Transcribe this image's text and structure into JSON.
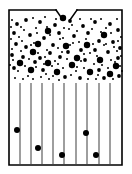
{
  "figure": {
    "domain": "diagram",
    "canvas": {
      "width": 132,
      "height": 174,
      "background": "#ffffff"
    },
    "stroke_color": "#000000",
    "particle_color": "#000000",
    "channel_color": "#1a1a1a"
  },
  "vessel": {
    "name": "vessel-body",
    "left": 9,
    "right": 122,
    "top": 10,
    "bottom": 165,
    "outline_width": 1.6,
    "notch": {
      "name": "top-notch-opening",
      "left_edge_start_x": 56,
      "left_edge_end_x": 63,
      "right_edge_start_x": 70,
      "right_edge_end_x": 77,
      "top_y": 10,
      "depth_y": 20,
      "gap_width": 7
    }
  },
  "regions": {
    "upper": {
      "name": "freeboard-particle-region",
      "label": "dispersed particle zone",
      "top": 11,
      "bottom": 83
    },
    "lower": {
      "name": "packed-bed-channel-region",
      "label": "vertical channel zone",
      "top": 83,
      "bottom": 164
    }
  },
  "channels": {
    "name": "vertical-channel-lines",
    "count": 9,
    "top_y": 83,
    "bottom_y": 164,
    "x_positions": [
      20,
      31,
      42,
      53,
      64,
      76,
      87,
      99,
      110
    ]
  },
  "chart_data": {
    "type": "scatter",
    "xlabel": "",
    "ylabel": "",
    "xlim": [
      9,
      122
    ],
    "ylim": [
      10,
      165
    ],
    "grid": false,
    "legend": null,
    "series": [
      {
        "name": "large-particles-upper",
        "marker": "filled-circle",
        "radius": 3.2,
        "points": [
          [
            63,
            18
          ],
          [
            48,
            31
          ],
          [
            104,
            35
          ],
          [
            87,
            45
          ],
          [
            33,
            52
          ],
          [
            66,
            46
          ],
          [
            20,
            63
          ],
          [
            48,
            63
          ],
          [
            77,
            58
          ],
          [
            100,
            60
          ],
          [
            116,
            66
          ],
          [
            31,
            70
          ],
          [
            57,
            72
          ],
          [
            90,
            72
          ],
          [
            110,
            74
          ],
          [
            38,
            44
          ],
          [
            72,
            65
          ]
        ]
      },
      {
        "name": "medium-particles-upper",
        "marker": "filled-circle",
        "radius": 1.9,
        "points": [
          [
            17,
            24
          ],
          [
            26,
            20
          ],
          [
            40,
            22
          ],
          [
            55,
            25
          ],
          [
            70,
            21
          ],
          [
            83,
            26
          ],
          [
            95,
            22
          ],
          [
            110,
            24
          ],
          [
            118,
            30
          ],
          [
            14,
            33
          ],
          [
            30,
            35
          ],
          [
            44,
            38
          ],
          [
            59,
            33
          ],
          [
            74,
            36
          ],
          [
            88,
            33
          ],
          [
            99,
            41
          ],
          [
            113,
            42
          ],
          [
            16,
            44
          ],
          [
            26,
            47
          ],
          [
            53,
            45
          ],
          [
            68,
            52
          ],
          [
            81,
            50
          ],
          [
            95,
            50
          ],
          [
            108,
            52
          ],
          [
            120,
            48
          ],
          [
            12,
            55
          ],
          [
            23,
            57
          ],
          [
            40,
            58
          ],
          [
            60,
            57
          ],
          [
            85,
            60
          ],
          [
            118,
            58
          ],
          [
            14,
            68
          ],
          [
            43,
            70
          ],
          [
            65,
            77
          ],
          [
            80,
            78
          ],
          [
            99,
            70
          ],
          [
            104,
            78
          ],
          [
            119,
            76
          ],
          [
            35,
            62
          ],
          [
            50,
            53
          ]
        ]
      },
      {
        "name": "fine-particles-upper",
        "marker": "filled-circle",
        "radius": 1.0,
        "points": [
          [
            12,
            20
          ],
          [
            21,
            27
          ],
          [
            33,
            18
          ],
          [
            36,
            28
          ],
          [
            45,
            17
          ],
          [
            50,
            35
          ],
          [
            60,
            39
          ],
          [
            64,
            28
          ],
          [
            77,
            31
          ],
          [
            80,
            19
          ],
          [
            92,
            29
          ],
          [
            101,
            19
          ],
          [
            106,
            28
          ],
          [
            117,
            19
          ],
          [
            121,
            37
          ],
          [
            11,
            27
          ],
          [
            19,
            37
          ],
          [
            24,
            30
          ],
          [
            37,
            33
          ],
          [
            47,
            27
          ],
          [
            56,
            19
          ],
          [
            69,
            29
          ],
          [
            73,
            43
          ],
          [
            86,
            39
          ],
          [
            91,
            19
          ],
          [
            104,
            45
          ],
          [
            111,
            33
          ],
          [
            118,
            41
          ],
          [
            11,
            39
          ],
          [
            22,
            41
          ],
          [
            34,
            43
          ],
          [
            47,
            50
          ],
          [
            58,
            48
          ],
          [
            63,
            38
          ],
          [
            72,
            25
          ],
          [
            79,
            42
          ],
          [
            93,
            44
          ],
          [
            101,
            32
          ],
          [
            114,
            47
          ],
          [
            121,
            56
          ],
          [
            12,
            49
          ],
          [
            21,
            51
          ],
          [
            31,
            45
          ],
          [
            38,
            53
          ],
          [
            45,
            57
          ],
          [
            55,
            61
          ],
          [
            62,
            52
          ],
          [
            70,
            45
          ],
          [
            77,
            67
          ],
          [
            84,
            54
          ],
          [
            90,
            53
          ],
          [
            97,
            56
          ],
          [
            106,
            44
          ],
          [
            111,
            60
          ],
          [
            117,
            51
          ],
          [
            13,
            60
          ],
          [
            18,
            71
          ],
          [
            25,
            66
          ],
          [
            28,
            76
          ],
          [
            36,
            67
          ],
          [
            41,
            77
          ],
          [
            46,
            74
          ],
          [
            52,
            66
          ],
          [
            58,
            64
          ],
          [
            67,
            59
          ],
          [
            71,
            75
          ],
          [
            76,
            71
          ],
          [
            84,
            68
          ],
          [
            88,
            79
          ],
          [
            94,
            64
          ],
          [
            102,
            65
          ],
          [
            108,
            68
          ],
          [
            113,
            79
          ],
          [
            120,
            66
          ],
          [
            15,
            78
          ],
          [
            23,
            79
          ],
          [
            33,
            79
          ],
          [
            49,
            79
          ],
          [
            59,
            80
          ],
          [
            96,
            79
          ],
          [
            122,
            71
          ],
          [
            10,
            65
          ],
          [
            29,
            59
          ],
          [
            44,
            64
          ],
          [
            53,
            76
          ],
          [
            63,
            68
          ],
          [
            81,
            61
          ],
          [
            98,
            75
          ],
          [
            115,
            62
          ]
        ]
      },
      {
        "name": "bed-particles-lower",
        "marker": "filled-circle",
        "radius": 3.0,
        "points": [
          [
            17,
            130
          ],
          [
            38,
            148
          ],
          [
            62,
            155
          ],
          [
            86,
            133
          ],
          [
            96,
            155
          ]
        ]
      }
    ]
  }
}
